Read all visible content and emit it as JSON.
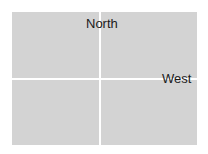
{
  "diagram": {
    "type": "quadrant-grid",
    "panel_color": "#d3d3d3",
    "background_color": "#ffffff",
    "panels": [
      {
        "position": "top-left"
      },
      {
        "position": "top-right"
      },
      {
        "position": "bottom-left"
      },
      {
        "position": "bottom-right"
      }
    ],
    "labels": {
      "north": "North",
      "west": "West"
    }
  }
}
